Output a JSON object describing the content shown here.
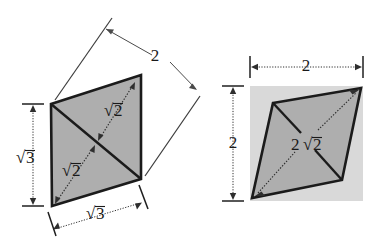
{
  "figure": {
    "background_color": "#ffffff",
    "shape_fill": "#aeaeae",
    "backdrop_fill": "#d9d9d9",
    "edge_color": "#1b1b1b",
    "dimension_color": "#2e2e2e"
  },
  "left_figure": {
    "name": "parallelogram-with-diagonal",
    "shape": "parallelogram",
    "vertices": [
      {
        "label": "top-left",
        "x": 51,
        "y": 104
      },
      {
        "label": "top-right",
        "x": 141,
        "y": 75
      },
      {
        "label": "bottom-right",
        "x": 141,
        "y": 179
      },
      {
        "label": "bottom-left",
        "x": 52,
        "y": 206
      }
    ],
    "labels": {
      "top_side": "2",
      "left_side_radicand": "3",
      "bottom_side_radicand": "3",
      "upper_diagonal_radicand": "2",
      "lower_diagonal_radicand": "2"
    },
    "dimensions": [
      {
        "name": "slant-side",
        "value": "2",
        "orientation": "diagonal"
      },
      {
        "name": "height",
        "value": "√3",
        "orientation": "vertical"
      },
      {
        "name": "base",
        "value": "√3",
        "orientation": "horizontal"
      }
    ],
    "diagonals": [
      {
        "name": "upper-diagonal",
        "value": "√2"
      },
      {
        "name": "lower-diagonal",
        "value": "√2"
      }
    ]
  },
  "right_figure": {
    "name": "rhombus-in-square",
    "shape": "rhombus",
    "backdrop": {
      "x": 250,
      "y": 86,
      "width": 113,
      "height": 115
    },
    "vertices": [
      {
        "label": "top-left",
        "x": 273,
        "y": 103
      },
      {
        "label": "top-right",
        "x": 361,
        "y": 88
      },
      {
        "label": "bottom-right",
        "x": 342,
        "y": 180
      },
      {
        "label": "bottom-left",
        "x": 252,
        "y": 198
      }
    ],
    "labels": {
      "width": "2",
      "height": "2",
      "diagonal_coefficient": "2",
      "diagonal_radicand": "2"
    },
    "dimensions": [
      {
        "name": "width",
        "value": "2",
        "orientation": "horizontal"
      },
      {
        "name": "height",
        "value": "2",
        "orientation": "vertical"
      }
    ],
    "diagonals": [
      {
        "name": "main-diagonal",
        "value": "2√2"
      }
    ]
  },
  "radical_symbol": "√"
}
